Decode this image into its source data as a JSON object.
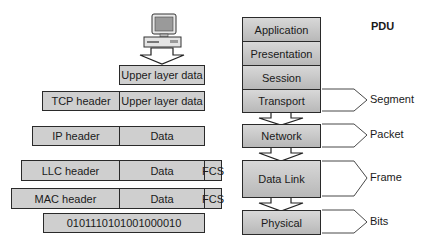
{
  "pdu_heading": "PDU",
  "layers": [
    {
      "name": "Application"
    },
    {
      "name": "Presentation"
    },
    {
      "name": "Session"
    },
    {
      "name": "Transport",
      "pdu": "Segment"
    },
    {
      "name": "Network",
      "pdu": "Packet"
    },
    {
      "name": "Data Link",
      "pdu": "Frame"
    },
    {
      "name": "Physical",
      "pdu": "Bits"
    }
  ],
  "encapsulation": {
    "upper": {
      "data": "Upper layer data"
    },
    "transport": {
      "header": "TCP header",
      "data": "Upper layer data"
    },
    "network": {
      "header": "IP header",
      "data": "Data"
    },
    "llc": {
      "header": "LLC header",
      "data": "Data",
      "trailer": "FCS"
    },
    "mac": {
      "header": "MAC header",
      "data": "Data",
      "trailer": "FCS"
    },
    "bits": {
      "value": "0101110101001000010"
    }
  },
  "colors": {
    "box_fill": "#cfcfcf",
    "border": "#2a2a2a"
  }
}
